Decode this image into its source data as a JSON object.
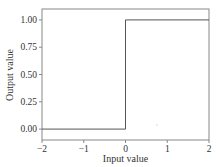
{
  "chart_data": {
    "type": "line",
    "title": "",
    "xlabel": "Input value",
    "ylabel": "Output value",
    "xlim": [
      -2,
      2
    ],
    "ylim": [
      -0.1,
      1.1
    ],
    "grid": false,
    "legend": null,
    "x_ticks": [
      -2,
      -1,
      0,
      1,
      2
    ],
    "x_tick_labels": [
      "−2",
      "−1",
      "0",
      "1",
      "2"
    ],
    "y_ticks": [
      0.0,
      0.25,
      0.5,
      0.75,
      1.0
    ],
    "y_tick_labels": [
      "0.00",
      "0.25",
      "0.50",
      "0.75",
      "1.00"
    ],
    "series": [
      {
        "name": "step function",
        "x": [
          -2,
          0,
          0,
          2
        ],
        "y": [
          0,
          0,
          1,
          1
        ],
        "color": "#555555"
      }
    ]
  },
  "colors": {
    "line": "#555555",
    "frame": "#888888",
    "text": "#333333"
  }
}
